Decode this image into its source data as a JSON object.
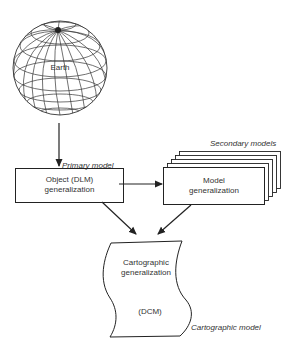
{
  "diagram": {
    "earth": {
      "label": "Earth"
    },
    "primary_model": {
      "label": "Primary model"
    },
    "object_box": {
      "line1": "Object (DLM)",
      "line2": "generalization"
    },
    "secondary_models": {
      "label": "Secondary models"
    },
    "model_box": {
      "line1": "Model",
      "line2": "generalization"
    },
    "cartographic_doc": {
      "line1": "Cartographic",
      "line2": "generalization",
      "line3": "(DCM)"
    },
    "cartographic_model": {
      "label": "Cartographic model"
    },
    "colors": {
      "stroke": "#222222",
      "background": "#ffffff"
    }
  }
}
